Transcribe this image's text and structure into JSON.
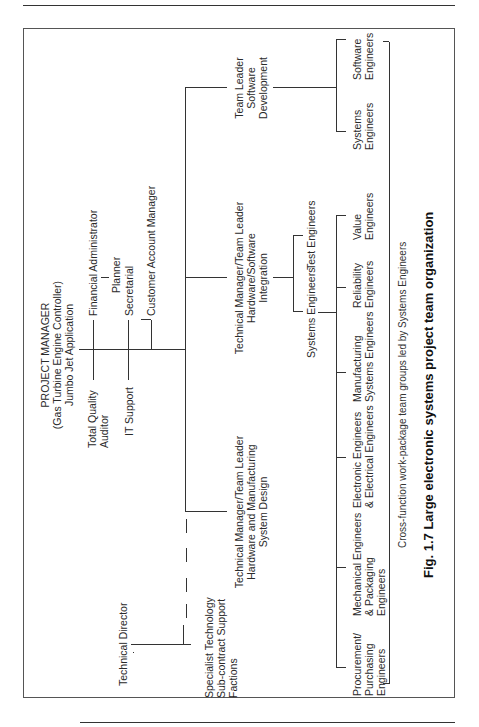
{
  "figure": {
    "caption": "Fig. 1.7  Large electronic systems project team organization",
    "note": "Cross-function work-package team groups led by Systems Engineers"
  },
  "org": {
    "project_manager": {
      "line1": "PROJECT MANAGER",
      "line2": "(Gas Turbine Engine Controller)",
      "line3": "Jumbo Jet Application"
    },
    "staff_left": {
      "quality_1": "Total Quality",
      "quality_2": "Auditor",
      "it": "IT Support"
    },
    "staff_right": {
      "finance": "Financial Administrator",
      "planner": "Planner",
      "secretarial": "Secretarial",
      "customer": "Customer Account Manager"
    },
    "technical_director": "Technical Director",
    "specialist": {
      "line1": "Specialist Technology",
      "line2": "Sub-contract Support",
      "line3": "Factions"
    },
    "hw_mfg": {
      "line1": "Technical Manager/Team Leader",
      "line2": "Hardware and Manufacturing",
      "line3": "System Design"
    },
    "hw_sw": {
      "line1": "Technical Manager/Team Leader",
      "line2": "Hardware/Software",
      "line3": "Integration"
    },
    "sw_dev": {
      "line1": "Team Leader",
      "line2": "Software",
      "line3": "Development"
    },
    "integration_children": {
      "systems": "Systems Engineers",
      "test": "Test Engineers"
    },
    "work_packages": [
      {
        "l1": "Procurement/",
        "l2": "Purchasing",
        "l3": "Engineers"
      },
      {
        "l1": "Mechanical Engineers",
        "l2": "& Packaging",
        "l3": "Engineers"
      },
      {
        "l1": "Electronic Engineers",
        "l2": "& Electrical Engineers",
        "l3": ""
      },
      {
        "l1": "Manufacturing",
        "l2": "Systems Engineers",
        "l3": ""
      },
      {
        "l1": "Reliability",
        "l2": "Engineers",
        "l3": ""
      },
      {
        "l1": "Value",
        "l2": "Engineers",
        "l3": ""
      }
    ],
    "sw_children": [
      {
        "l1": "Systems",
        "l2": "Engineers"
      },
      {
        "l1": "Software",
        "l2": "Engineers"
      }
    ]
  }
}
